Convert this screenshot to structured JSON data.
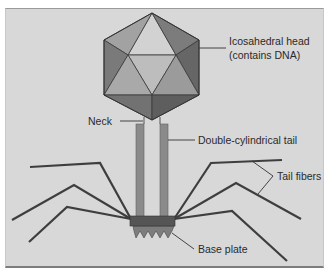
{
  "figure": {
    "background_color": "#d8d8d8",
    "labels": {
      "head_line1": "Icosahedral head",
      "head_line2": "(contains DNA)",
      "neck": "Neck",
      "tail": "Double-cylindrical tail",
      "tail_fibers": "Tail fibers",
      "base_plate": "Base plate"
    },
    "colors": {
      "tail_tube": "#8a8a8a",
      "fiber": "#3e3e3e",
      "base_plate_top": "#555555",
      "base_plate_spikes": "#7d7d7d",
      "leader_line": "#333333"
    }
  }
}
